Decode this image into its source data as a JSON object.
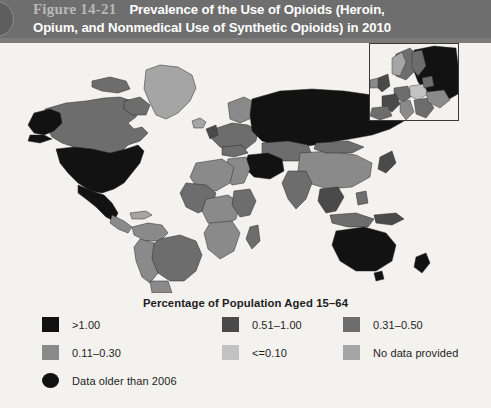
{
  "header": {
    "figure_label": "Figure 14-21",
    "title_line1": "Prevalence of the Use of Opioids (Heroin,",
    "title_line2": "Opium, and Nonmedical Use of Synthetic Opioids) in 2010",
    "band_color": "#6e6e6e",
    "label_color": "#b8b8b8",
    "title_color": "#ffffff"
  },
  "legend": {
    "title": "Percentage of Population Aged 15–64",
    "items": [
      {
        "label": ">1.00",
        "color": "#121212",
        "shape": "square"
      },
      {
        "label": "0.51–1.00",
        "color": "#4a4a4a",
        "shape": "square"
      },
      {
        "label": "0.31–0.50",
        "color": "#6d6d6d",
        "shape": "square"
      },
      {
        "label": "0.11–0.30",
        "color": "#8a8a8a",
        "shape": "square"
      },
      {
        "label": "<=0.10",
        "color": "#c2c2c2",
        "shape": "square"
      },
      {
        "label": "No data provided",
        "color": "#a5a5a5",
        "shape": "square"
      },
      {
        "label": "Data older than 2006",
        "color": "#111111",
        "shape": "circle"
      }
    ]
  },
  "map": {
    "background_color": "#f4f2ef",
    "border_color": "#2b2b2b",
    "inset_name": "europe-inset",
    "regions": [
      {
        "name": "united-states",
        "class": ">1.00",
        "color": "#121212"
      },
      {
        "name": "alaska",
        "class": ">1.00",
        "color": "#121212"
      },
      {
        "name": "canada",
        "class": "0.31-0.50",
        "color": "#6d6d6d"
      },
      {
        "name": "greenland",
        "class": "no-data",
        "color": "#a5a5a5"
      },
      {
        "name": "mexico",
        "class": "0.11-0.30",
        "color": "#8a8a8a"
      },
      {
        "name": "brazil",
        "class": "0.31-0.50",
        "color": "#6d6d6d"
      },
      {
        "name": "argentina",
        "class": "0.11-0.30",
        "color": "#8a8a8a"
      },
      {
        "name": "russia",
        "class": ">1.00",
        "color": "#121212"
      },
      {
        "name": "china",
        "class": "0.11-0.30",
        "color": "#8a8a8a"
      },
      {
        "name": "india",
        "class": "0.31-0.50",
        "color": "#6d6d6d"
      },
      {
        "name": "iran",
        "class": ">1.00",
        "color": "#121212"
      },
      {
        "name": "australia",
        "class": ">1.00",
        "color": "#121212"
      },
      {
        "name": "africa",
        "class": "mixed",
        "color": "#8a8a8a"
      }
    ]
  }
}
